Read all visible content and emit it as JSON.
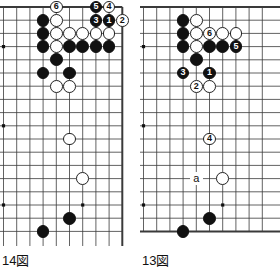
{
  "page": {
    "type": "go-game-diagram-pair",
    "background": "#ffffff",
    "stone_colors": {
      "black": "#111111",
      "white": "#ffffff",
      "line": "#3a3a3a"
    }
  },
  "boards": [
    {
      "id": "board-14",
      "caption": "14図",
      "columns": 10,
      "rows": 18,
      "edges": {
        "top": true,
        "right": true,
        "left": false,
        "bottom": false
      },
      "star_points": [
        {
          "col": 0,
          "row": 3
        },
        {
          "col": 0,
          "row": 9
        },
        {
          "col": 0,
          "row": 15
        },
        {
          "col": 6,
          "row": 15
        }
      ],
      "stones": [
        {
          "col": 4,
          "row": 0,
          "color": "white",
          "label": "6"
        },
        {
          "col": 7,
          "row": 0,
          "color": "black",
          "label": "5"
        },
        {
          "col": 8,
          "row": 0,
          "color": "white",
          "label": "4"
        },
        {
          "col": 7,
          "row": 1,
          "color": "black",
          "label": "3"
        },
        {
          "col": 8,
          "row": 1,
          "color": "black",
          "label": "1"
        },
        {
          "col": 9,
          "row": 1,
          "color": "white",
          "label": "2"
        },
        {
          "col": 3,
          "row": 1,
          "color": "black",
          "label": ""
        },
        {
          "col": 4,
          "row": 1,
          "color": "white",
          "label": ""
        },
        {
          "col": 3,
          "row": 2,
          "color": "black",
          "label": ""
        },
        {
          "col": 4,
          "row": 2,
          "color": "white",
          "label": ""
        },
        {
          "col": 5,
          "row": 2,
          "color": "white",
          "label": ""
        },
        {
          "col": 6,
          "row": 2,
          "color": "white",
          "label": ""
        },
        {
          "col": 7,
          "row": 2,
          "color": "white",
          "label": ""
        },
        {
          "col": 8,
          "row": 2,
          "color": "white",
          "label": ""
        },
        {
          "col": 3,
          "row": 3,
          "color": "black",
          "label": ""
        },
        {
          "col": 4,
          "row": 3,
          "color": "white",
          "label": ""
        },
        {
          "col": 5,
          "row": 3,
          "color": "black",
          "label": ""
        },
        {
          "col": 6,
          "row": 3,
          "color": "black",
          "label": ""
        },
        {
          "col": 7,
          "row": 3,
          "color": "black",
          "label": ""
        },
        {
          "col": 8,
          "row": 3,
          "color": "black",
          "label": ""
        },
        {
          "col": 4,
          "row": 4,
          "color": "black",
          "label": ""
        },
        {
          "col": 3,
          "row": 5,
          "color": "black",
          "label": ""
        },
        {
          "col": 5,
          "row": 5,
          "color": "black",
          "label": ""
        },
        {
          "col": 4,
          "row": 6,
          "color": "white",
          "label": ""
        },
        {
          "col": 5,
          "row": 6,
          "color": "white",
          "label": ""
        },
        {
          "col": 5,
          "row": 10,
          "color": "white",
          "label": ""
        },
        {
          "col": 6,
          "row": 13,
          "color": "white",
          "label": ""
        },
        {
          "col": 5,
          "row": 16,
          "color": "black",
          "label": ""
        },
        {
          "col": 3,
          "row": 17,
          "color": "black",
          "label": ""
        }
      ],
      "letter_marks": []
    },
    {
      "id": "board-13",
      "caption": "13図",
      "columns": 10,
      "rows": 18,
      "edges": {
        "top": true,
        "right": false,
        "left": false,
        "bottom": true
      },
      "star_points": [
        {
          "col": 0,
          "row": 3
        },
        {
          "col": 0,
          "row": 9
        },
        {
          "col": 0,
          "row": 15
        },
        {
          "col": 6,
          "row": 15
        }
      ],
      "stones": [
        {
          "col": 3,
          "row": 1,
          "color": "black",
          "label": ""
        },
        {
          "col": 4,
          "row": 1,
          "color": "white",
          "label": ""
        },
        {
          "col": 3,
          "row": 2,
          "color": "black",
          "label": ""
        },
        {
          "col": 4,
          "row": 2,
          "color": "white",
          "label": ""
        },
        {
          "col": 5,
          "row": 2,
          "color": "white",
          "label": "6"
        },
        {
          "col": 6,
          "row": 2,
          "color": "white",
          "label": ""
        },
        {
          "col": 7,
          "row": 2,
          "color": "white",
          "label": ""
        },
        {
          "col": 3,
          "row": 3,
          "color": "black",
          "label": ""
        },
        {
          "col": 4,
          "row": 3,
          "color": "white",
          "label": ""
        },
        {
          "col": 5,
          "row": 3,
          "color": "black",
          "label": ""
        },
        {
          "col": 6,
          "row": 3,
          "color": "black",
          "label": ""
        },
        {
          "col": 7,
          "row": 3,
          "color": "black",
          "label": "5"
        },
        {
          "col": 4,
          "row": 4,
          "color": "black",
          "label": ""
        },
        {
          "col": 3,
          "row": 5,
          "color": "black",
          "label": "3"
        },
        {
          "col": 5,
          "row": 5,
          "color": "black",
          "label": "1"
        },
        {
          "col": 4,
          "row": 6,
          "color": "white",
          "label": "2"
        },
        {
          "col": 5,
          "row": 6,
          "color": "white",
          "label": ""
        },
        {
          "col": 5,
          "row": 10,
          "color": "white",
          "label": "4"
        },
        {
          "col": 6,
          "row": 13,
          "color": "white",
          "label": ""
        },
        {
          "col": 5,
          "row": 16,
          "color": "black",
          "label": ""
        },
        {
          "col": 3,
          "row": 17,
          "color": "black",
          "label": ""
        }
      ],
      "letter_marks": [
        {
          "col": 4,
          "row": 13,
          "text": "a"
        }
      ]
    }
  ]
}
